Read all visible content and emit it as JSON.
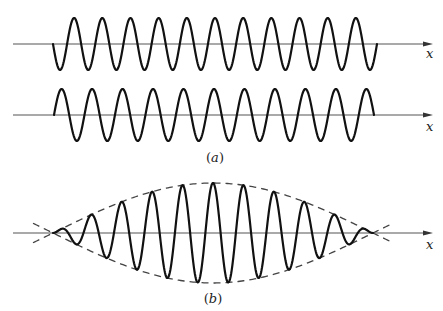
{
  "figure": {
    "panels": [
      {
        "id": "a",
        "label": "(a)",
        "label_letter": "a",
        "waves": [
          {
            "name": "wave-a1",
            "axis_y": 44,
            "axis_x_start": 13,
            "axis_x_end": 433,
            "axis_label": "x",
            "x_start": 53,
            "x_end": 377,
            "periods": 11.5,
            "amplitude": 26,
            "sign": -1
          },
          {
            "name": "wave-a2",
            "axis_y": 115,
            "axis_x_start": 13,
            "axis_x_end": 433,
            "axis_label": "x",
            "x_start": 54,
            "x_end": 374,
            "periods": 10.5,
            "amplitude": 26,
            "sign": 1
          }
        ]
      },
      {
        "id": "b",
        "label": "(b)",
        "label_letter": "b",
        "waves": [
          {
            "name": "wave-b-beat",
            "axis_y": 233,
            "axis_x_start": 13,
            "axis_x_end": 433,
            "axis_label": "x",
            "x_start": 53,
            "x_end": 373,
            "periods": 10.5,
            "amplitude": 50,
            "sign": 1,
            "envelope": {
              "type": "half-sine",
              "node_left": 53,
              "node_right": 373,
              "amplitude": 50,
              "extend": 20
            }
          }
        ]
      }
    ],
    "colors": {
      "wave": "#111111",
      "axis": "#555555",
      "envelope": "#444444",
      "background": "#ffffff"
    }
  }
}
